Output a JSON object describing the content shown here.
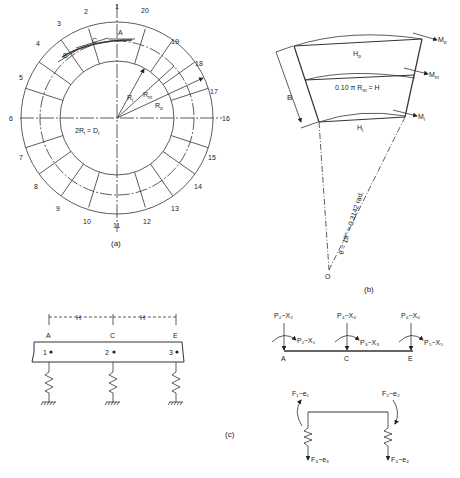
{
  "figure_a": {
    "caption": "(a)",
    "segment_numbers": [
      "1",
      "2",
      "3",
      "4",
      "5",
      "6",
      "7",
      "8",
      "9",
      "10",
      "11",
      "12",
      "13",
      "14",
      "15",
      "16",
      "17",
      "18",
      "19",
      "20"
    ],
    "points": [
      "A",
      "C",
      "E"
    ],
    "radii": [
      "R_i",
      "R_m",
      "R_o"
    ],
    "radius_labels": {
      "ri": "R",
      "ri_sub": "i",
      "rm": "R",
      "rm_sub": "m",
      "ro": "R",
      "ro_sub": "o"
    },
    "diameter_eq": {
      "pre": "2R",
      "sub": "i",
      "post": " = D",
      "sub2": "i"
    }
  },
  "figure_b": {
    "caption": "(b)",
    "outer": {
      "h": "H",
      "h_sub": "o",
      "m": "M",
      "m_sub": "o"
    },
    "mid": {
      "eq": "0.10 π R",
      "eq_sub": "m",
      "eq_post": " = H",
      "m": "M",
      "m_sub": "m"
    },
    "inner": {
      "h": "H",
      "h_sub": "i",
      "m": "M",
      "m_sub": "i"
    },
    "width_label": "B",
    "angle_label": "θ = 18° = 0.3142 rad.",
    "origin": "O"
  },
  "figure_c": {
    "caption": "(c)",
    "spacing": [
      "H",
      "H"
    ],
    "supports": [
      "A",
      "C",
      "E"
    ],
    "nodes": [
      "1",
      "2",
      "3"
    ],
    "forces": {
      "a_top": "P₂−X₂",
      "a_side": "P₁−X₁",
      "c_top": "P₄−X₄",
      "c_side": "P₃−X₃",
      "e_top": "P₆−X₆",
      "e_side": "P₅−X₅"
    },
    "springs": {
      "f1": "F₁−e₁",
      "f2": "F₂−e₂",
      "f3": "F₃−e₃",
      "f4": "F₄−e₄"
    }
  }
}
